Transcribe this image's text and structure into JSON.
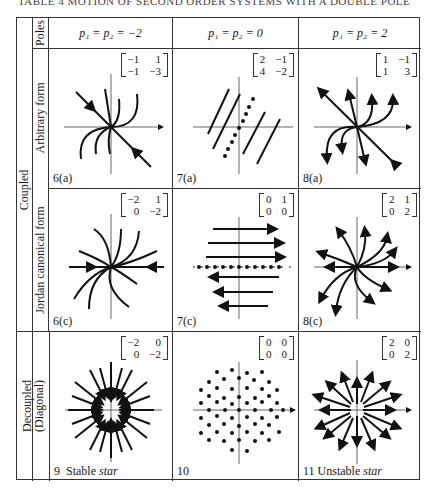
{
  "title": "TABLE 4  MOTION OF SECOND ORDER SYSTEMS WITH A DOUBLE POLE",
  "header": {
    "poles_label": "Poles",
    "columns": [
      "p₁ = p₂ = −2",
      "p₁ = p₂ = 0",
      "p₁ = p₂ = 2"
    ]
  },
  "row_groups": {
    "coupled": "Coupled",
    "decoupled": "Decoupled (Diagonal)"
  },
  "rows": [
    {
      "label": "Arbitrary form",
      "cells": [
        {
          "caption": "6(a)",
          "matrix": [
            [
              "−1",
              "1"
            ],
            [
              "−1",
              "−3"
            ]
          ],
          "x_axis": "x₁",
          "y_axis": "x₂"
        },
        {
          "caption": "7(a)",
          "matrix": [
            [
              "2",
              "−1"
            ],
            [
              "4",
              "−2"
            ]
          ],
          "x_axis": "x₁",
          "y_axis": "x₂"
        },
        {
          "caption": "8(a)",
          "matrix": [
            [
              "1",
              "−1"
            ],
            [
              "1",
              "3"
            ]
          ],
          "x_axis": "x₁",
          "y_axis": "x₂"
        }
      ]
    },
    {
      "label": "Jordan canonical form",
      "cells": [
        {
          "caption": "6(c)",
          "matrix": [
            [
              "−2",
              "1"
            ],
            [
              "0",
              "−2"
            ]
          ],
          "x_axis": "x₁*",
          "y_axis": "x₂*"
        },
        {
          "caption": "7(c)",
          "matrix": [
            [
              "0",
              "1"
            ],
            [
              "0",
              "0"
            ]
          ],
          "x_axis": "x₁*",
          "y_axis": "x₂*"
        },
        {
          "caption": "8(c)",
          "matrix": [
            [
              "2",
              "1"
            ],
            [
              "0",
              "2"
            ]
          ],
          "x_axis": "x₁*",
          "y_axis": "x₂*"
        }
      ]
    },
    {
      "label": "",
      "cells": [
        {
          "caption_num": "9",
          "caption_text": "Stable",
          "caption_em": "star",
          "matrix": [
            [
              "−2",
              "0"
            ],
            [
              "0",
              "−2"
            ]
          ],
          "x_axis": "x₁",
          "y_axis": "x₂"
        },
        {
          "caption_num": "10",
          "caption_text": "",
          "caption_em": "",
          "matrix": [
            [
              "0",
              "0"
            ],
            [
              "0",
              "0"
            ]
          ],
          "x_axis": "x₁",
          "y_axis": "x₂"
        },
        {
          "caption_num": "11",
          "caption_text": "Unstable",
          "caption_em": "star",
          "matrix": [
            [
              "2",
              "0"
            ],
            [
              "0",
              "2"
            ]
          ],
          "x_axis": "x₁",
          "y_axis": "x₂"
        }
      ]
    }
  ]
}
